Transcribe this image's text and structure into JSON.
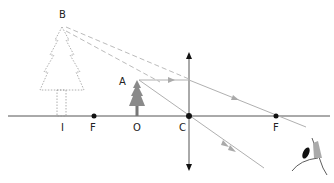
{
  "diagram": {
    "labels": {
      "B": "B",
      "A": "A",
      "I": "I",
      "F_left": "F",
      "O": "O",
      "C": "C",
      "F_right": "F"
    },
    "colors": {
      "axis": "#555555",
      "ray": "#b0b0b0",
      "dashed": "#bbbbbb",
      "point": "#111111",
      "tree": "#8a8a8a"
    }
  }
}
